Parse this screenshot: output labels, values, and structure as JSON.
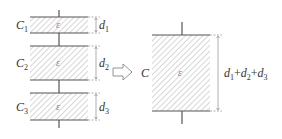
{
  "left": {
    "capacitors": [
      {
        "name": "C",
        "sub": "1",
        "dielectric": "ε",
        "gap_label": "d",
        "gap_sub": "1"
      },
      {
        "name": "C",
        "sub": "2",
        "dielectric": "ε",
        "gap_label": "d",
        "gap_sub": "2"
      },
      {
        "name": "C",
        "sub": "3",
        "dielectric": "ε",
        "gap_label": "d",
        "gap_sub": "3"
      }
    ]
  },
  "arrow": {
    "icon": "hollow-right-arrow"
  },
  "right": {
    "name": "C",
    "dielectric": "ε",
    "gap_parts": [
      {
        "d": "d",
        "sub": "1"
      },
      {
        "op": "+"
      },
      {
        "d": "d",
        "sub": "2"
      },
      {
        "op": "+"
      },
      {
        "d": "d",
        "sub": "3"
      }
    ]
  },
  "colors": {
    "plate": "#555555",
    "hatch": "#bbbbbb",
    "dim": "#888888"
  }
}
